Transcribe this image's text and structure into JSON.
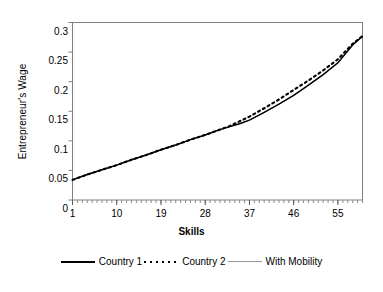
{
  "chart_data": {
    "type": "line",
    "title": "",
    "xlabel": "Skills",
    "ylabel": "Entrepreneur's Wage",
    "xlim": [
      1,
      60
    ],
    "ylim": [
      0,
      0.3
    ],
    "xticks": [
      1,
      10,
      19,
      28,
      37,
      46,
      55
    ],
    "xtick_labels": [
      "1",
      "10",
      "19",
      "28",
      "37",
      "46",
      "55"
    ],
    "yticks": [
      0,
      0.05,
      0.1,
      0.15,
      0.2,
      0.25,
      0.3
    ],
    "ytick_labels": [
      "0",
      "0.05",
      "0.1",
      "0.15",
      "0.2",
      "0.25",
      "0.3"
    ],
    "grid": false,
    "minor_xticks": true,
    "legend_position": "bottom",
    "x": [
      1,
      4,
      7,
      10,
      13,
      16,
      19,
      22,
      25,
      28,
      31,
      33,
      35,
      37,
      40,
      43,
      46,
      49,
      52,
      55,
      58,
      60
    ],
    "series": [
      {
        "name": "Country 1",
        "style": "solid",
        "color": "#000000",
        "values": [
          0.034,
          0.043,
          0.051,
          0.059,
          0.068,
          0.076,
          0.085,
          0.093,
          0.102,
          0.11,
          0.119,
          0.124,
          0.129,
          0.135,
          0.148,
          0.162,
          0.177,
          0.194,
          0.212,
          0.232,
          0.262,
          0.277
        ]
      },
      {
        "name": "Country 2",
        "style": "dotted",
        "color": "#000000",
        "values": [
          0.034,
          0.043,
          0.051,
          0.059,
          0.068,
          0.076,
          0.085,
          0.093,
          0.102,
          0.11,
          0.119,
          0.125,
          0.133,
          0.141,
          0.155,
          0.17,
          0.186,
          0.202,
          0.219,
          0.238,
          0.264,
          0.277
        ]
      },
      {
        "name": "With Mobility",
        "style": "solid-gray",
        "color": "#9a9a9a",
        "values": [
          0.034,
          0.043,
          0.051,
          0.059,
          0.068,
          0.076,
          0.085,
          0.093,
          0.102,
          0.11,
          0.119,
          0.124,
          0.129,
          0.135,
          0.148,
          0.162,
          0.177,
          0.194,
          0.212,
          0.232,
          0.262,
          0.277
        ]
      }
    ]
  },
  "axis": {
    "y_title": "Entrepreneur's Wage",
    "x_title": "Skills"
  },
  "legend": {
    "items": [
      {
        "label": "Country 1"
      },
      {
        "label": "Country 2"
      },
      {
        "label": "With Mobility"
      }
    ]
  },
  "colors": {
    "frame": "#808080",
    "line": "#000000",
    "gray_line": "#9a9a9a",
    "background": "#ffffff"
  }
}
